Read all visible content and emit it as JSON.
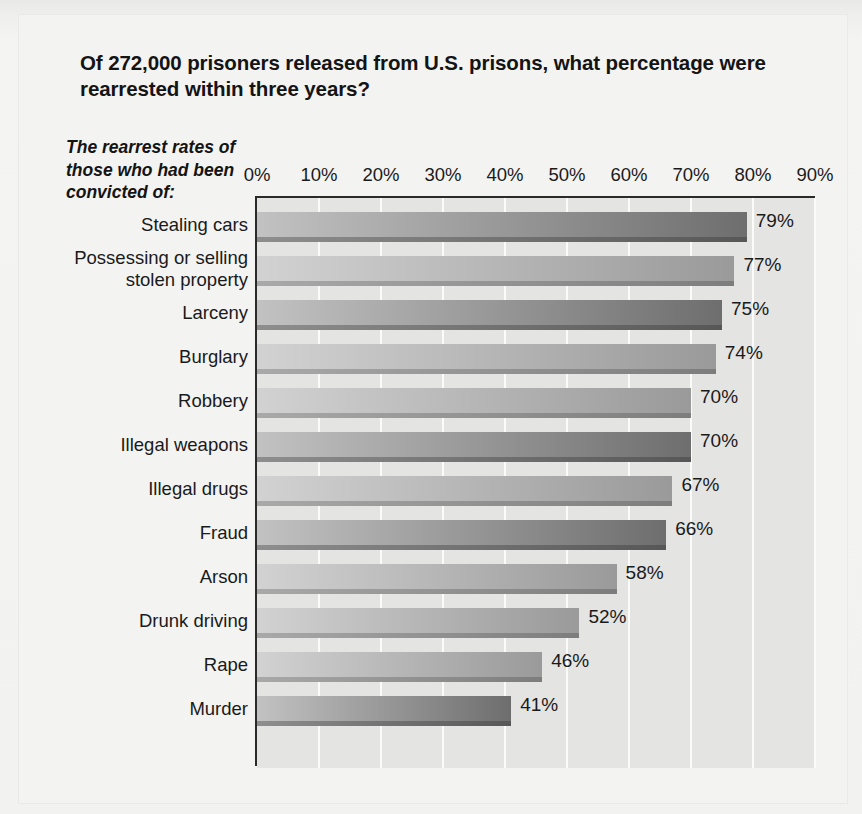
{
  "title": "Of 272,000 prisoners released from U.S. prisons, what percentage were rearrested within three years?",
  "subtitle": "The rearrest rates of those who had been convicted of:",
  "colors": {
    "page_background": "#f2f2f0",
    "plot_background": "#e4e4e2",
    "gridline": "#fbfbfa",
    "axis_line": "#2a2a2a",
    "text": "#1a1a1a",
    "bar_light_start": "#d2d2d2",
    "bar_light_end": "#9a9a9a",
    "bar_dark_start": "#c2c2c2",
    "bar_dark_end": "#6e6e6e"
  },
  "chart_data": {
    "type": "bar",
    "orientation": "horizontal",
    "title": "Of 272,000 prisoners released from U.S. prisons, what percentage were rearrested within three years?",
    "subtitle": "The rearrest rates of those who had been convicted of:",
    "xlabel": "",
    "ylabel": "",
    "xlim": [
      0,
      90
    ],
    "grid": true,
    "legend": false,
    "tick_labels": [
      "0%",
      "10%",
      "20%",
      "30%",
      "40%",
      "50%",
      "60%",
      "70%",
      "80%",
      "90%"
    ],
    "tick_values": [
      0,
      10,
      20,
      30,
      40,
      50,
      60,
      70,
      80,
      90
    ],
    "categories": [
      "Stealing cars",
      "Possessing or selling stolen property",
      "Larceny",
      "Burglary",
      "Robbery",
      "Illegal weapons",
      "Illegal drugs",
      "Fraud",
      "Arson",
      "Drunk driving",
      "Rape",
      "Murder"
    ],
    "category_lines": [
      [
        "Stealing cars"
      ],
      [
        "Possessing or selling",
        "stolen property"
      ],
      [
        "Larceny"
      ],
      [
        "Burglary"
      ],
      [
        "Robbery"
      ],
      [
        "Illegal weapons"
      ],
      [
        "Illegal drugs"
      ],
      [
        "Fraud"
      ],
      [
        "Arson"
      ],
      [
        "Drunk driving"
      ],
      [
        "Rape"
      ],
      [
        "Murder"
      ]
    ],
    "values": [
      79,
      77,
      75,
      74,
      70,
      70,
      67,
      66,
      58,
      52,
      46,
      41
    ],
    "data_labels": [
      "79%",
      "77%",
      "75%",
      "74%",
      "70%",
      "70%",
      "67%",
      "66%",
      "58%",
      "52%",
      "46%",
      "41%"
    ],
    "bar_shades": [
      "dark",
      "light",
      "dark",
      "light",
      "light",
      "dark",
      "light",
      "dark",
      "light",
      "light",
      "light",
      "dark"
    ]
  }
}
